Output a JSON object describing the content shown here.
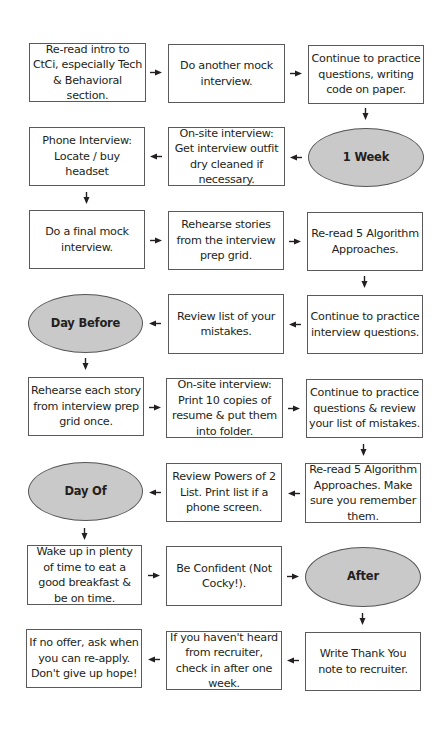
{
  "diagram": {
    "type": "flowchart",
    "title": "",
    "node_colors": {
      "box_fill": "#ffffff",
      "box_border": "#5a5a5a",
      "milestone_fill": "#c9c9c9",
      "text": "#231f20"
    },
    "nodes": {
      "n1": "Re-read intro to CtCi, especially Tech & Behavioral section.",
      "n2": "Do another mock interview.",
      "n3": "Continue to practice questions, writing code on paper.",
      "m1": "1 Week",
      "n4": "On-site interview: Get interview outfit dry cleaned if necessary.",
      "n5": "Phone Interview: Locate / buy headset",
      "n6": "Do a final mock interview.",
      "n7": "Rehearse stories from the interview prep grid.",
      "n8": "Re-read 5 Algorithm Approaches.",
      "n9": "Continue to practice interview questions.",
      "n10": "Review list of your mistakes.",
      "m2": "Day Before",
      "n11": "Rehearse each story from interview prep grid once.",
      "n12": "On-site interview: Print 10 copies of resume & put them into folder.",
      "n13": "Continue to practice questions & review your list of mistakes.",
      "n14": "Re-read 5 Algorithm Approaches. Make sure you remember them.",
      "n15": "Review Powers of 2 List. Print list if a phone screen.",
      "m3": "Day Of",
      "n16": "Wake up in plenty of time to eat a good breakfast & be on time.",
      "n17": "Be Confident (Not Cocky!).",
      "m4": "After",
      "n18": "Write Thank You note to recruiter.",
      "n19": "If you haven't heard from recruiter, check in after one week.",
      "n20": "If no offer, ask when you can re-apply. Don't give up hope!"
    },
    "edges": [
      [
        "n1",
        "n2"
      ],
      [
        "n2",
        "n3"
      ],
      [
        "n3",
        "m1"
      ],
      [
        "m1",
        "n4"
      ],
      [
        "n4",
        "n5"
      ],
      [
        "n5",
        "n6"
      ],
      [
        "n6",
        "n7"
      ],
      [
        "n7",
        "n8"
      ],
      [
        "n8",
        "n9"
      ],
      [
        "n9",
        "n10"
      ],
      [
        "n10",
        "m2"
      ],
      [
        "m2",
        "n11"
      ],
      [
        "n11",
        "n12"
      ],
      [
        "n12",
        "n13"
      ],
      [
        "n13",
        "n14"
      ],
      [
        "n14",
        "n15"
      ],
      [
        "n15",
        "m3"
      ],
      [
        "m3",
        "n16"
      ],
      [
        "n16",
        "n17"
      ],
      [
        "n17",
        "m4"
      ],
      [
        "m4",
        "n18"
      ],
      [
        "n18",
        "n19"
      ],
      [
        "n19",
        "n20"
      ]
    ]
  }
}
